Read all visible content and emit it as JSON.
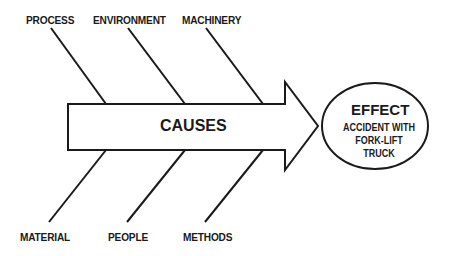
{
  "diagram": {
    "type": "fishbone",
    "spine_label": "CAUSES",
    "effect": {
      "title": "EFFECT",
      "description": "ACCIDENT WITH FORK-LIFT TRUCK"
    },
    "top_causes": [
      {
        "label": "PROCESS"
      },
      {
        "label": "ENVIRONMENT"
      },
      {
        "label": "MACHINERY"
      }
    ],
    "bottom_causes": [
      {
        "label": "MATERIAL"
      },
      {
        "label": "PEOPLE"
      },
      {
        "label": "METHODS"
      }
    ],
    "colors": {
      "stroke": "#1a1a1a",
      "fill": "#ffffff"
    }
  }
}
